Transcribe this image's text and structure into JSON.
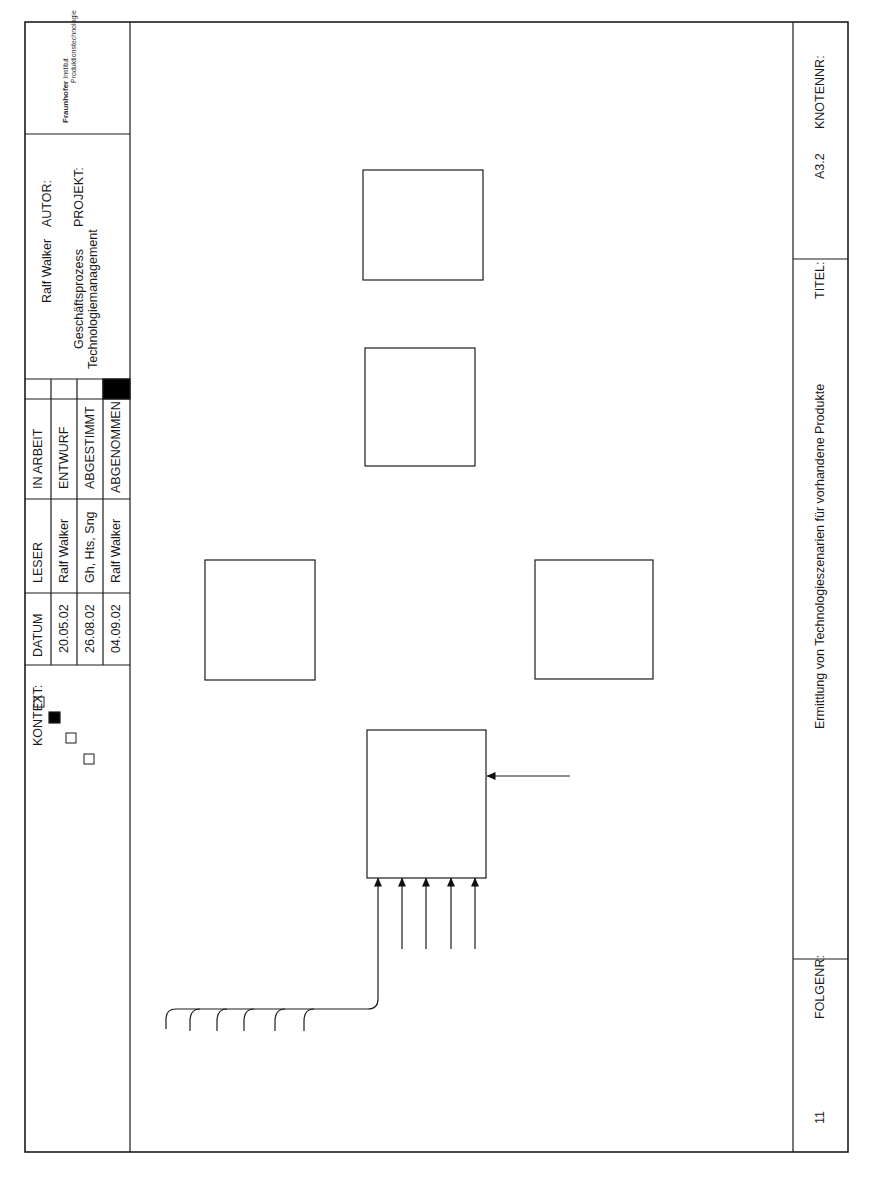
{
  "header": {
    "logo": {
      "name": "Fraunhofer",
      "subtitle_line1": "Institut",
      "subtitle_line2": "Produktionstechnologie"
    },
    "autor_label": "AUTOR:",
    "autor_value": "Ralf Walker",
    "projekt_label": "PROJEKT:",
    "projekt_line1": "Geschäftsprozess",
    "projekt_line2": "Technologiemanagement",
    "status_rows": [
      {
        "label": "IN ARBEIT",
        "checked": false
      },
      {
        "label": "ENTWURF",
        "checked": false
      },
      {
        "label": "ABGESTIMMT",
        "checked": false
      },
      {
        "label": "ABGENOMMEN",
        "checked": true
      }
    ],
    "leser_header": "LESER",
    "datum_header": "DATUM",
    "review_rows": [
      {
        "leser": "Ralf Walker",
        "datum": "20.05.02"
      },
      {
        "leser": "Gh, Hts, Sng",
        "datum": "26.08.02"
      },
      {
        "leser": "Ralf Walker",
        "datum": "04.09.02"
      }
    ],
    "kontext_label": "KONTEXT:"
  },
  "footer": {
    "knotennr_label": "KNOTENNR:",
    "knotennr_value": "A3.2",
    "titel_label": "TITEL:",
    "titel_value": "Ermittlung von Technologieszenarien für vorhandene Produkte",
    "folgenr_label": "FOLGENR:",
    "folgenr_value": "11"
  },
  "diagram": {
    "activities": [
      {
        "id": "A3.2.1",
        "line1": "Produkt-",
        "line2": "analyse"
      },
      {
        "id": "A3.2.2",
        "line1": "Ideengenerierung",
        "line2": ""
      },
      {
        "id": "A3.2.3",
        "line1": "Technologie-",
        "line2": "recherche"
      },
      {
        "id": "A3.2.4",
        "line1": "Technologie-",
        "line2": "zuordnung"
      },
      {
        "id": "A3.2.5",
        "line1": "Detailbewertung",
        "line2": "der Ansätze"
      }
    ],
    "inputs_a321": [
      "Konstuktionszeichnungen",
      "Leistungsmerkmale",
      "Kostenstuktur",
      "Arbeitspläne",
      "Pflichtenheft",
      "Stückliste"
    ],
    "controls_a321": [
      {
        "line1": "Strategische",
        "line2": "Technologiefelder"
      },
      {
        "line1": "Technologieportfolio",
        "line2": ""
      },
      {
        "line1": "Wettbewerbsdaten",
        "line2": ""
      },
      {
        "line1": "Unternehmensspezifische",
        "line2": "Randbedingungen"
      }
    ],
    "mech_a321": {
      "line1": "Produkt-",
      "line2": "datenbank"
    },
    "controls_a322": [
      "Optimierungsziele",
      "Problembeschreibung"
    ],
    "mech_a322": "Synektik",
    "output_a322": "Gestaltänderungen",
    "control_a324": {
      "line1": "Aktuelle",
      "line2": "Prozesskette"
    },
    "mech_a324": {
      "line1": "Morphologischer",
      "line2": "Kasten [Bild 3.14]"
    },
    "output_a324": {
      "line1": "Technologie-",
      "line2": "ansätze"
    },
    "mech_a323_1": "[Anhang 8.5]",
    "mech_a323_2": {
      "line1": "Technologie-",
      "line2": "datenbank"
    },
    "output_a323": {
      "line1": "Detaillierte",
      "line2": "Technologieinformation"
    },
    "control_a325": {
      "line1": "Investitions-",
      "line2": "budget"
    },
    "mech_a325": {
      "line1": "Bewertungs-",
      "line2": "matrix [Bild 3.16]"
    },
    "outputs_a325": [
      {
        "line1": "Technologie-",
        "line2": "szenarien",
        "line3": ""
      },
      {
        "line1": "Herstell-",
        "line2": "kosten-",
        "line3": "abschätzung"
      }
    ],
    "tunnel_mark": "( )"
  }
}
